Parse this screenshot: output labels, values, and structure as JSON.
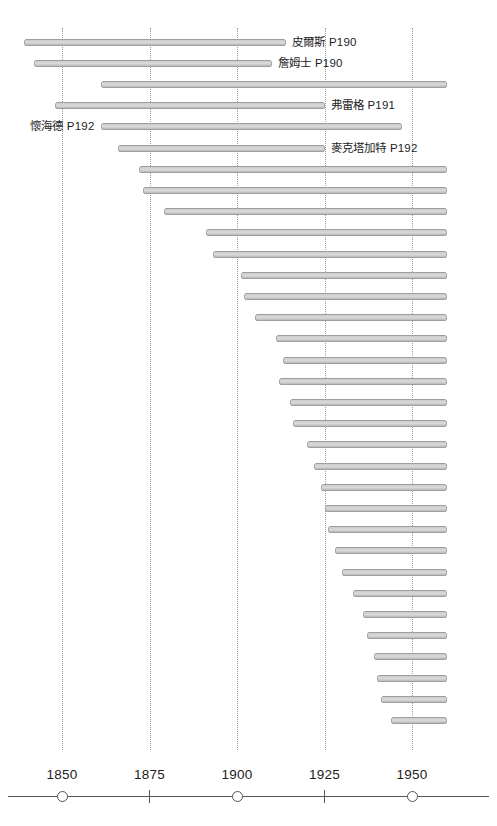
{
  "chart_data": {
    "type": "bar",
    "orientation": "horizontal",
    "title": "",
    "subtitle": "",
    "xlabel": "",
    "ylabel": "",
    "xlim": [
      1832,
      1960
    ],
    "grid": true,
    "legend": null,
    "x_ticks": [
      1850,
      1875,
      1900,
      1925,
      1950
    ],
    "x_tick_labels": [
      "1850",
      "1875",
      "1900",
      "1925",
      "1950"
    ],
    "x_tick_markers": [
      "circle",
      "tick",
      "circle",
      "tick",
      "circle"
    ],
    "categories": [
      "皮爾斯 P190",
      "詹姆士 P190",
      "bar-3",
      "弗雷格 P191",
      "懷海德 P192",
      "麥克塔加特 P192",
      "bar-7",
      "bar-8",
      "bar-9",
      "bar-10",
      "bar-11",
      "bar-12",
      "bar-13",
      "bar-14",
      "bar-15",
      "bar-16",
      "bar-17",
      "bar-18",
      "bar-19",
      "bar-20",
      "bar-21",
      "bar-22",
      "bar-23",
      "bar-24",
      "bar-25",
      "bar-26",
      "bar-27",
      "bar-28",
      "bar-29",
      "bar-30",
      "bar-31",
      "bar-32",
      "bar-33"
    ],
    "bars": [
      {
        "index": 1,
        "label": "皮爾斯 P190",
        "label_side": "right",
        "start_year": 1839,
        "end_year": 1914
      },
      {
        "index": 2,
        "label": "詹姆士 P190",
        "label_side": "right",
        "start_year": 1842,
        "end_year": 1910
      },
      {
        "index": 3,
        "label": "",
        "label_side": "none",
        "start_year": 1861,
        "end_year": 1960
      },
      {
        "index": 4,
        "label": "弗雷格 P191",
        "label_side": "right",
        "start_year": 1848,
        "end_year": 1925
      },
      {
        "index": 5,
        "label": "懷海德 P192",
        "label_side": "left",
        "start_year": 1861,
        "end_year": 1947
      },
      {
        "index": 6,
        "label": "麥克塔加特 P192",
        "label_side": "right",
        "start_year": 1866,
        "end_year": 1925
      },
      {
        "index": 7,
        "label": "",
        "label_side": "none",
        "start_year": 1872,
        "end_year": 1960
      },
      {
        "index": 8,
        "label": "",
        "label_side": "none",
        "start_year": 1873,
        "end_year": 1960
      },
      {
        "index": 9,
        "label": "",
        "label_side": "none",
        "start_year": 1879,
        "end_year": 1960
      },
      {
        "index": 10,
        "label": "",
        "label_side": "none",
        "start_year": 1891,
        "end_year": 1960
      },
      {
        "index": 11,
        "label": "",
        "label_side": "none",
        "start_year": 1893,
        "end_year": 1960
      },
      {
        "index": 12,
        "label": "",
        "label_side": "none",
        "start_year": 1901,
        "end_year": 1960
      },
      {
        "index": 13,
        "label": "",
        "label_side": "none",
        "start_year": 1902,
        "end_year": 1960
      },
      {
        "index": 14,
        "label": "",
        "label_side": "none",
        "start_year": 1905,
        "end_year": 1960
      },
      {
        "index": 15,
        "label": "",
        "label_side": "none",
        "start_year": 1911,
        "end_year": 1960
      },
      {
        "index": 16,
        "label": "",
        "label_side": "none",
        "start_year": 1913,
        "end_year": 1960
      },
      {
        "index": 17,
        "label": "",
        "label_side": "none",
        "start_year": 1912,
        "end_year": 1960
      },
      {
        "index": 18,
        "label": "",
        "label_side": "none",
        "start_year": 1915,
        "end_year": 1960
      },
      {
        "index": 19,
        "label": "",
        "label_side": "none",
        "start_year": 1916,
        "end_year": 1960
      },
      {
        "index": 20,
        "label": "",
        "label_side": "none",
        "start_year": 1920,
        "end_year": 1960
      },
      {
        "index": 21,
        "label": "",
        "label_side": "none",
        "start_year": 1922,
        "end_year": 1960
      },
      {
        "index": 22,
        "label": "",
        "label_side": "none",
        "start_year": 1924,
        "end_year": 1960
      },
      {
        "index": 23,
        "label": "",
        "label_side": "none",
        "start_year": 1925,
        "end_year": 1960
      },
      {
        "index": 24,
        "label": "",
        "label_side": "none",
        "start_year": 1926,
        "end_year": 1960
      },
      {
        "index": 25,
        "label": "",
        "label_side": "none",
        "start_year": 1928,
        "end_year": 1960
      },
      {
        "index": 26,
        "label": "",
        "label_side": "none",
        "start_year": 1930,
        "end_year": 1960
      },
      {
        "index": 27,
        "label": "",
        "label_side": "none",
        "start_year": 1933,
        "end_year": 1960
      },
      {
        "index": 28,
        "label": "",
        "label_side": "none",
        "start_year": 1936,
        "end_year": 1960
      },
      {
        "index": 29,
        "label": "",
        "label_side": "none",
        "start_year": 1937,
        "end_year": 1960
      },
      {
        "index": 30,
        "label": "",
        "label_side": "none",
        "start_year": 1939,
        "end_year": 1960
      },
      {
        "index": 31,
        "label": "",
        "label_side": "none",
        "start_year": 1940,
        "end_year": 1960
      },
      {
        "index": 32,
        "label": "",
        "label_side": "none",
        "start_year": 1941,
        "end_year": 1960
      },
      {
        "index": 33,
        "label": "",
        "label_side": "none",
        "start_year": 1944,
        "end_year": 1960
      }
    ],
    "colors": {
      "bar_fill": "#d4d4d4",
      "bar_stroke": "#8e8e8e",
      "gridline": "#9a9a9a",
      "axis": "#555555",
      "text": "#1d1d1d",
      "background": "#ffffff"
    }
  },
  "labels": {
    "pierce": "皮爾斯 P190",
    "james": "詹姆士 P190",
    "frege": "弗雷格 P191",
    "whitehead": "懷海德 P192",
    "mctaggart": "麥克塔加特 P192"
  },
  "axis": {
    "ticks": [
      {
        "value": 1850,
        "label": "1850",
        "marker": "circle"
      },
      {
        "value": 1875,
        "label": "1875",
        "marker": "tick"
      },
      {
        "value": 1900,
        "label": "1900",
        "marker": "circle"
      },
      {
        "value": 1925,
        "label": "1925",
        "marker": "tick"
      },
      {
        "value": 1950,
        "label": "1950",
        "marker": "circle"
      }
    ]
  }
}
